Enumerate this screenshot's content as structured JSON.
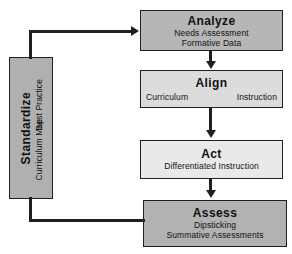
{
  "diagram": {
    "colors": {
      "box_dark": "#b6b6b6",
      "box_mid": "#dcdcdc",
      "box_light": "#e9e9e9",
      "box_assess": "#b2b2b2",
      "box_standardize": "#b0b0b0",
      "outline": "#231f20",
      "background": "#ffffff",
      "text": "#111111"
    },
    "nodes": {
      "standardize": {
        "title": "Standardize",
        "sub_top": "Best Practice",
        "sub_bottom": "Curriculum Map"
      },
      "analyze": {
        "title": "Analyze",
        "sub1": "Needs Assessment",
        "sub2": "Formative Data"
      },
      "align": {
        "title": "Align",
        "sub_left": "Curriculum",
        "sub_right": "Instruction"
      },
      "act": {
        "title": "Act",
        "sub1": "Differentiated Instruction"
      },
      "assess": {
        "title": "Assess",
        "sub1": "Dipsticking",
        "sub2": "Summative Assessments"
      }
    },
    "connectors": [
      {
        "name": "standardize-to-analyze",
        "from": "standardize",
        "to": "analyze",
        "arrowhead": "right"
      },
      {
        "name": "analyze-to-align",
        "from": "analyze",
        "to": "align",
        "arrowhead": "down"
      },
      {
        "name": "align-to-act",
        "from": "align",
        "to": "act",
        "arrowhead": "down"
      },
      {
        "name": "act-to-assess",
        "from": "act",
        "to": "assess",
        "arrowhead": "down"
      },
      {
        "name": "assess-to-standardize",
        "from": "assess",
        "to": "standardize",
        "arrowhead": "none"
      }
    ]
  }
}
